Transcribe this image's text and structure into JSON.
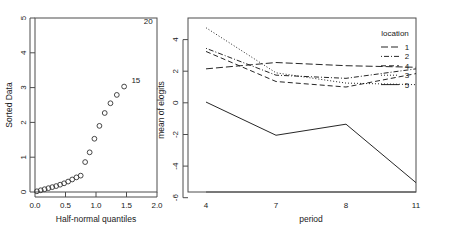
{
  "figure": {
    "background": "#ffffff",
    "foreground": "#1a1a1a",
    "width": 452,
    "height": 235,
    "panel_count": 2
  },
  "chart_data": [
    {
      "id": "half-normal-plot",
      "type": "scatter",
      "title": "",
      "xlabel": "Half-normal quantiles",
      "ylabel": "Sorted Data",
      "xlim": [
        0.0,
        2.0
      ],
      "ylim": [
        0.0,
        5.0
      ],
      "xticks": [
        "0.0",
        "0.5",
        "1.0",
        "1.5",
        "2.0"
      ],
      "xtick_values": [
        0.0,
        0.5,
        1.0,
        1.5,
        2.0
      ],
      "yticks": [
        "0",
        "1",
        "2",
        "3",
        "4",
        "5"
      ],
      "ytick_values": [
        0,
        1,
        2,
        3,
        4,
        5
      ],
      "grid": false,
      "legend": "none",
      "marker": "open-circle",
      "marker_size": 3,
      "x": [
        0.031,
        0.094,
        0.157,
        0.22,
        0.283,
        0.347,
        0.412,
        0.477,
        0.543,
        0.61,
        0.679,
        0.749,
        0.822,
        0.896,
        0.974,
        1.056,
        1.143,
        1.237,
        1.341,
        1.461
      ],
      "y": [
        0.02,
        0.05,
        0.08,
        0.11,
        0.14,
        0.17,
        0.21,
        0.25,
        0.3,
        0.36,
        0.42,
        0.47,
        0.86,
        1.14,
        1.53,
        1.9,
        2.27,
        2.55,
        2.79,
        3.03
      ],
      "point_labels": [
        {
          "text": "20",
          "x": 1.93,
          "y": 4.83,
          "anchor": "end",
          "note": "corner annotation"
        },
        {
          "text": "15",
          "x": 1.58,
          "y": 3.12,
          "anchor": "start",
          "note": "labels the largest plotted point"
        }
      ]
    },
    {
      "id": "interaction-plot",
      "type": "line",
      "title": "",
      "xlabel": "period",
      "ylabel": "mean of elogits",
      "categories": [
        "4",
        "7",
        "8",
        "11"
      ],
      "xtick_labels": [
        "4",
        "7",
        "8",
        "11"
      ],
      "ylim": [
        -6,
        5
      ],
      "yticks": [
        "4",
        "2",
        "0",
        "-2",
        "-4",
        "-6"
      ],
      "ytick_values": [
        4,
        2,
        0,
        -2,
        -4,
        -6
      ],
      "grid": false,
      "legend_title": "location",
      "legend_position": "top-right-inside",
      "legend_order": [
        "1",
        "2",
        "4",
        "3",
        "5"
      ],
      "series": [
        {
          "name": "1",
          "dash": "longdash",
          "dash_pattern": "7,3",
          "values": [
            2.15,
            2.55,
            2.35,
            2.25
          ]
        },
        {
          "name": "2",
          "dash": "dotdash",
          "dash_pattern": "1,2,5,2",
          "values": [
            3.45,
            1.75,
            1.55,
            2.15
          ]
        },
        {
          "name": "4",
          "dash": "dashed",
          "dash_pattern": "5,3",
          "values": [
            3.25,
            1.35,
            1.0,
            1.85
          ]
        },
        {
          "name": "3",
          "dash": "dotted",
          "dash_pattern": "1,2",
          "values": [
            4.75,
            1.9,
            1.25,
            1.15
          ]
        },
        {
          "name": "5",
          "dash": "solid",
          "dash_pattern": "",
          "values": [
            0.05,
            -2.05,
            -1.35,
            -5.05
          ]
        }
      ]
    }
  ],
  "left_panel": {
    "name": "half-normal-plot",
    "axis_labels": {
      "x": "Half-normal quantiles",
      "y": "Sorted Data"
    },
    "annotations": [
      "20",
      "15"
    ]
  },
  "right_panel": {
    "name": "interaction-plot",
    "axis_labels": {
      "x": "period",
      "y": "mean of elogits"
    },
    "legend": {
      "title": "location",
      "entries": [
        {
          "label": "1",
          "style": "long-dash"
        },
        {
          "label": "2",
          "style": "dot-dash"
        },
        {
          "label": "4",
          "style": "dash"
        },
        {
          "label": "3",
          "style": "dot"
        },
        {
          "label": "5",
          "style": "solid"
        }
      ]
    }
  }
}
